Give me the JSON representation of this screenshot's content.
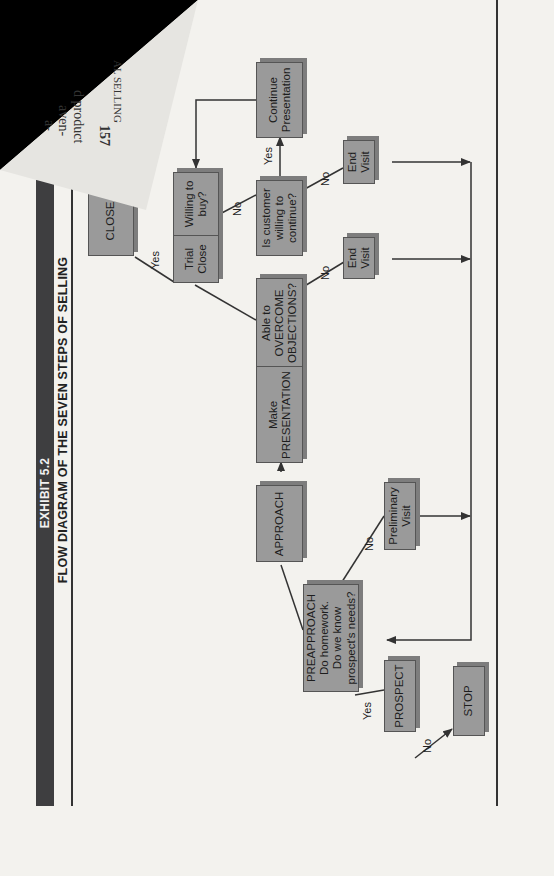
{
  "header": {
    "exhibit_label": "EXHIBIT 5.2",
    "title": "FLOW DIAGRAM OF THE SEVEN STEPS OF SELLING"
  },
  "folded_page": {
    "page_number": "157",
    "text_fragments": [
      "AL SELLING",
      "d product",
      "aven-",
      "a-"
    ]
  },
  "nodes": {
    "prospect": "PROSPECT",
    "stop": "STOP",
    "preapproach": "PREAPPROACH\nDo homework.\nDo we know\nprospect's needs?",
    "preliminary_visit": "Preliminary\nVisit",
    "approach": "APPROACH",
    "make_presentation": "Make\nPRESENTATION",
    "overcome_objections": "Able to\nOVERCOME\nOBJECTIONS?",
    "end_visit_1": "End\nVisit",
    "trial_close": "Trial\nClose",
    "willing_to_buy": "Willing to\nbuy?",
    "customer_continue": "Is customer\nwilling to\ncontinue?",
    "end_visit_2": "End\nVisit",
    "continue_presentation": "Continue\nPresentation",
    "close": "CLOSE"
  },
  "edge_labels": {
    "prospect_no": "No",
    "prospect_yes": "Yes",
    "preapproach_no": "No",
    "objections_no": "No",
    "trial_no": "No",
    "close_yes": "Yes",
    "continue_yes": "Yes",
    "continue_no": "No"
  },
  "colors": {
    "box_fill": "#9a9a9a",
    "box_shadow": "#7d7d7d",
    "banner": "#3e3e40",
    "line": "#333333",
    "paper": "#f3f2ee"
  }
}
